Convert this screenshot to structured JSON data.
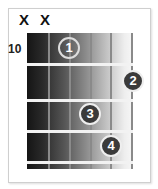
{
  "diagram": {
    "type": "guitar-chord-chart",
    "fret_position_label": "10",
    "muted_strings": [
      "X",
      "X"
    ],
    "fingers": [
      {
        "label": "1",
        "string": 3,
        "fret": 1
      },
      {
        "label": "2",
        "string": 6,
        "fret": 2
      },
      {
        "label": "3",
        "string": 4,
        "fret": 3
      },
      {
        "label": "4",
        "string": 5,
        "fret": 4
      }
    ],
    "colors": {
      "board_dark": "#151515",
      "board_light": "#f7f7f7",
      "finger_fill": "#3a3a3a",
      "fret": "#f2f2f2"
    }
  }
}
